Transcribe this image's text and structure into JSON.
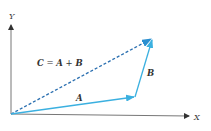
{
  "diagram": {
    "axes": {
      "x_label": "X",
      "y_label": "Y",
      "origin": [
        11,
        114
      ],
      "x_end": [
        190,
        116
      ],
      "y_end": [
        11,
        24
      ]
    },
    "vectors": [
      {
        "name": "A",
        "label": "A",
        "from": [
          11,
          114
        ],
        "to": [
          135,
          97
        ],
        "style": "solid",
        "color": "#3bb0e0"
      },
      {
        "name": "B",
        "label": "B",
        "from": [
          135,
          97
        ],
        "to": [
          153,
          38
        ],
        "style": "solid",
        "color": "#3bb0e0"
      },
      {
        "name": "C",
        "label": "C = A + B",
        "from": [
          11,
          114
        ],
        "to": [
          153,
          38
        ],
        "style": "dashed",
        "color": "#2a6fb0"
      }
    ],
    "equation": {
      "c": "C",
      "eq": " = ",
      "a": "A",
      "plus": " + ",
      "b": "B"
    },
    "colors": {
      "axis": "#555555",
      "vector_solid": "#3bb0e0",
      "vector_dashed": "#2a6fb0",
      "text": "#333333"
    }
  }
}
